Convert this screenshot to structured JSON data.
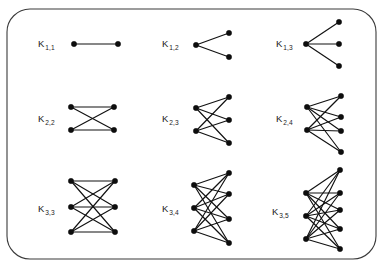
{
  "figure": {
    "frame": {
      "x": 7,
      "y": 9,
      "width": 369,
      "height": 250,
      "radius": 23,
      "stroke_color": "#3b3b3b",
      "background_color": "#ffffff"
    },
    "style": {
      "node_color": "#0d0d0d",
      "edge_color": "#111111",
      "label_color": "#1a1a1a",
      "node_radius": 2.7
    }
  },
  "chart_data": {
    "type": "diagram",
    "graphs": [
      {
        "id": "k-1-1",
        "label_base": "K",
        "label_sub": "1,1",
        "m": 1,
        "n": 1,
        "edges": 1,
        "label_x": 38,
        "label_y": 47,
        "left_x": 74,
        "right_x": 118,
        "left_ys": [
          44
        ],
        "right_ys": [
          44
        ]
      },
      {
        "id": "k-1-2",
        "label_base": "K",
        "label_sub": "1,2",
        "m": 1,
        "n": 2,
        "edges": 2,
        "label_x": 162,
        "label_y": 47,
        "left_x": 196,
        "right_x": 229,
        "left_ys": [
          45
        ],
        "right_ys": [
          33,
          57
        ]
      },
      {
        "id": "k-1-3",
        "label_base": "K",
        "label_sub": "1,3",
        "m": 1,
        "n": 3,
        "edges": 3,
        "label_x": 276,
        "label_y": 47,
        "left_x": 306,
        "right_x": 339,
        "left_ys": [
          44
        ],
        "right_ys": [
          22,
          44,
          66
        ]
      },
      {
        "id": "k-2-2",
        "label_base": "K",
        "label_sub": "2,2",
        "m": 2,
        "n": 2,
        "edges": 4,
        "label_x": 38,
        "label_y": 122,
        "left_x": 71,
        "right_x": 114,
        "left_ys": [
          107,
          130
        ],
        "right_ys": [
          107,
          130
        ]
      },
      {
        "id": "k-2-3",
        "label_base": "K",
        "label_sub": "2,3",
        "m": 2,
        "n": 3,
        "edges": 6,
        "label_x": 162,
        "label_y": 122,
        "left_x": 196,
        "right_x": 229,
        "left_ys": [
          108,
          131
        ],
        "right_ys": [
          97,
          120,
          143
        ]
      },
      {
        "id": "k-2-4",
        "label_base": "K",
        "label_sub": "2,4",
        "m": 2,
        "n": 4,
        "edges": 8,
        "label_x": 276,
        "label_y": 122,
        "left_x": 307,
        "right_x": 341,
        "left_ys": [
          107,
          130
        ],
        "right_ys": [
          96,
          117,
          131,
          152
        ]
      },
      {
        "id": "k-3-3",
        "label_base": "K",
        "label_sub": "3,3",
        "m": 3,
        "n": 3,
        "edges": 9,
        "label_x": 38,
        "label_y": 212,
        "left_x": 71,
        "right_x": 115,
        "left_ys": [
          181,
          207,
          232
        ],
        "right_ys": [
          181,
          207,
          232
        ]
      },
      {
        "id": "k-3-4",
        "label_base": "K",
        "label_sub": "3,4",
        "m": 3,
        "n": 4,
        "edges": 12,
        "label_x": 162,
        "label_y": 212,
        "left_x": 194,
        "right_x": 229,
        "left_ys": [
          185,
          208,
          231
        ],
        "right_ys": [
          173,
          194,
          219,
          243
        ]
      },
      {
        "id": "k-3-5",
        "label_base": "K",
        "label_sub": "3,5",
        "m": 3,
        "n": 5,
        "edges": 15,
        "label_x": 272,
        "label_y": 215,
        "left_x": 306,
        "right_x": 340,
        "left_ys": [
          193,
          216,
          239
        ],
        "right_ys": [
          170,
          193,
          210,
          229,
          249
        ]
      }
    ]
  }
}
